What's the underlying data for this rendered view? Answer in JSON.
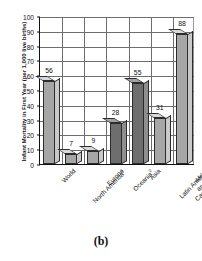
{
  "caption": "(b)",
  "chart_data": {
    "type": "bar",
    "title": "",
    "xlabel": "",
    "ylabel": "Infant Mortality in First Year (per 1,000 live births)",
    "ylim": [
      0,
      100
    ],
    "ytick_step": 10,
    "yticks": [
      0,
      10,
      20,
      30,
      40,
      50,
      60,
      70,
      80,
      90,
      100
    ],
    "grid": "both",
    "legend": "none",
    "categories": [
      "World",
      "North America",
      "Europe",
      "Oceania",
      "Asia",
      "Latin America and the Caribbean",
      "Africa"
    ],
    "category_footnotes": [
      "",
      "1",
      "",
      "2",
      "",
      "",
      ""
    ],
    "category_lines": [
      [
        "World"
      ],
      [
        "North America"
      ],
      [
        "Europe"
      ],
      [
        "Oceania"
      ],
      [
        "Asia"
      ],
      [
        "Latin America",
        "and the",
        "Caribbean"
      ],
      [
        "Africa"
      ]
    ],
    "values": [
      56,
      7,
      9,
      28,
      55,
      31,
      88
    ],
    "value_labels": [
      "56",
      "7",
      "9",
      "28",
      "55",
      "31",
      "88"
    ],
    "bar_shades": [
      "light",
      "light",
      "light",
      "dark",
      "dark",
      "light",
      "light"
    ],
    "colors": {
      "bar_light_face": "#a6a6a6",
      "bar_dark_face": "#6e6e6e",
      "bar_light_side": "#c9c9c9",
      "bar_dark_side": "#8f8f8f",
      "bar_light_top": "#d8d8d8",
      "bar_dark_top": "#a2a2a2",
      "grid": "#6d6d6d",
      "axis": "#111111",
      "background": "#ffffff"
    }
  }
}
